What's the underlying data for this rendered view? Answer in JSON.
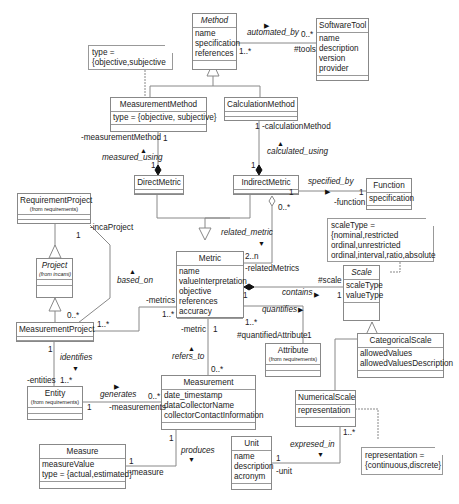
{
  "classes": {
    "method": {
      "name": "Method",
      "attrs": [
        "name",
        "specification",
        "references"
      ]
    },
    "software_tool": {
      "name": "SoftwareTool",
      "attrs": [
        "name",
        "description",
        "version",
        "provider"
      ]
    },
    "measurement_method": {
      "name": "MeasurementMethod",
      "attrs": [
        "type = {objective, subjective}"
      ]
    },
    "calculation_method": {
      "name": "CalculationMethod",
      "attrs": []
    },
    "direct_metric": {
      "name": "DirectMetric",
      "attrs": []
    },
    "indirect_metric": {
      "name": "IndirectMetric",
      "attrs": []
    },
    "function": {
      "name": "Function",
      "attrs": [
        "specification"
      ]
    },
    "requirement_project": {
      "name": "RequirementProject",
      "from": "(from requirements)",
      "attrs": []
    },
    "project": {
      "name": "Project",
      "from": "(from incami)",
      "attrs": []
    },
    "measurement_project": {
      "name": "MeasurementProject",
      "attrs": []
    },
    "metric": {
      "name": "Metric",
      "attrs": [
        "name",
        "valueInterpretation",
        "objective",
        "references",
        "accuracy"
      ]
    },
    "scale": {
      "name": "Scale",
      "attrs": [
        "scaleType",
        "valueType"
      ]
    },
    "categorical_scale": {
      "name": "CategoricalScale",
      "attrs": [
        "allowedValues",
        "allowedValuesDescription"
      ]
    },
    "attribute": {
      "name": "Attribute",
      "from": "(from requirements)",
      "attrs": []
    },
    "entity": {
      "name": "Entity",
      "from": "(from requirements)",
      "attrs": []
    },
    "measurement": {
      "name": "Measurement",
      "attrs": [
        "date_timestamp",
        "dataCollectorName",
        "collectorContactInformation"
      ]
    },
    "numerical_scale": {
      "name": "NumericalScale",
      "attrs": [
        "representation"
      ]
    },
    "measure": {
      "name": "Measure",
      "attrs": [
        "measureValue",
        "type = {actual,estimated}"
      ]
    },
    "unit": {
      "name": "Unit",
      "attrs": [
        "name",
        "description",
        "acronym"
      ]
    }
  },
  "notes": {
    "method_type": [
      "type =",
      "{objective,subjective"
    ],
    "scale_type": [
      "scaleType =",
      "{nominal,restricted",
      "ordinal,unrestricted",
      "ordinal,interval,ratio,absolute"
    ],
    "representation": [
      "representation =",
      "{continuous,discrete}"
    ]
  },
  "associations": {
    "automated_by": {
      "name": "automated_by",
      "mult_a": "1..*",
      "mult_b": "0..*",
      "role_b": "#tools"
    },
    "measured_using": {
      "name": "measured_using",
      "role": "-measurementMethod",
      "mult_a": "1",
      "mult_b": "1"
    },
    "calculated_using": {
      "name": "calculated_using",
      "role": "-calculationMethod",
      "mult_a": "1",
      "mult_b": "1"
    },
    "specified_by": {
      "name": "specified_by",
      "mult_a": "1",
      "mult_b": "1",
      "role_b": "-function"
    },
    "related_metric": {
      "name": "related_metric",
      "mult_a": "0..*",
      "mult_b": "2..n",
      "role_b": "-relatedMetrics"
    },
    "based_on": {
      "name": "based_on",
      "role": "-incaProject",
      "mult_a": "1",
      "mult_b": "0..*"
    },
    "metrics": {
      "role": "-metrics",
      "mult_a": "1..*",
      "mult_b": "1..*"
    },
    "contains": {
      "name": "contains",
      "role_b": "#scale",
      "mult_a": "1",
      "mult_b": "1"
    },
    "quantifies": {
      "name": "quantifies",
      "mult_a": "1..*",
      "role_b": "#quantifiedAttribute",
      "mult_b": "1"
    },
    "refers_to": {
      "name": "refers_to",
      "role": "-metric",
      "mult_a": "1",
      "mult_b": "0..*"
    },
    "identifies": {
      "name": "identifies",
      "mult_a": "1",
      "role_b": "-entities",
      "mult_b": "1..*"
    },
    "generates": {
      "name": "generates",
      "mult_a": "1",
      "mult_b": "0..*",
      "role_b": "-measurements"
    },
    "produces": {
      "name": "produces",
      "mult_a": "1",
      "mult_b": "1",
      "role_b": "-measure"
    },
    "expresed_in": {
      "name": "expresed_in",
      "mult_a": "1..*",
      "mult_b": "1",
      "role_b": "-unit"
    }
  }
}
